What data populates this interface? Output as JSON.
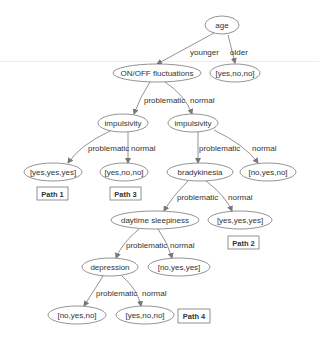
{
  "diagram": {
    "type": "decision-tree",
    "colors": {
      "stroke": "#777777",
      "text": "#333333",
      "background": "#ffffff"
    },
    "nodes": {
      "age": "age",
      "onoff": "ON/OFF fluctuations",
      "older_leaf": "[yes,no,no]",
      "impulsivity_left": "impulsivity",
      "impulsivity_right": "impulsivity",
      "leaf_path1": "[yes,yes,yes]",
      "leaf_path3": "[yes,no,no]",
      "bradykinesia": "bradykinesia",
      "leaf_impulsivity_normal": "[no,yes,no]",
      "daytime_sleepiness": "daytime sleepiness",
      "leaf_path2": "[yes,yes,yes]",
      "depression": "depression",
      "leaf_daytime_normal": "[no,yes,yes]",
      "leaf_depression_problematic": "[no,yes,no]",
      "leaf_path4": "[yes,no,no]"
    },
    "edges": {
      "age_younger": "younger",
      "age_older": "older",
      "onoff_problematic": "problematic",
      "onoff_normal": "normal",
      "impl_left_problematic": "problematic",
      "impl_left_normal": "normal",
      "impl_right_problematic": "problematic",
      "impl_right_normal": "normal",
      "brady_problematic": "problematic",
      "brady_normal": "normal",
      "daytime_problematic": "problematic",
      "daytime_normal": "normal",
      "depression_problematic": "problematic",
      "depression_normal": "normal"
    },
    "paths": {
      "path1": "Path 1",
      "path2": "Path 2",
      "path3": "Path 3",
      "path4": "Path 4"
    }
  }
}
